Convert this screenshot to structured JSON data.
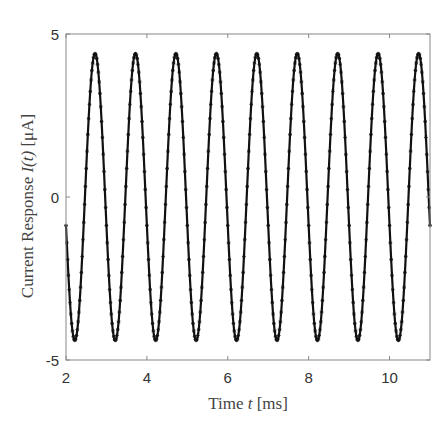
{
  "chart_data": {
    "type": "line",
    "title": "",
    "xlabel": "Time t [ms]",
    "ylabel": "Current Response I(t) [μA]",
    "xlabel_parts": [
      "Time ",
      "t",
      " [ms]"
    ],
    "ylabel_parts": [
      "Current Response ",
      "I(t)",
      " [μA]"
    ],
    "xlim": [
      2,
      11
    ],
    "ylim": [
      -5,
      5
    ],
    "xticks": [
      2,
      4,
      6,
      8,
      10
    ],
    "yticks": [
      -5,
      0,
      5
    ],
    "xtick_labels": [
      "2",
      "4",
      "6",
      "8",
      "10"
    ],
    "ytick_labels": [
      "-5",
      "0",
      "5"
    ],
    "grid": false,
    "legend": null,
    "series": [
      {
        "name": "I(t)",
        "color": "#111111",
        "marker": "asterisk",
        "line": "solid",
        "model": "I(t) = -4.4 * sin(2*pi*1.0*(t - 2) + 0.2)",
        "amplitude": 4.4,
        "frequency_khz": 1.0,
        "phase_offset": 0.2,
        "sample_step_ms": 0.02,
        "key_points": {
          "start": [
            2.0,
            -1.0
          ],
          "first_trough": [
            2.22,
            -4.4
          ],
          "peaks_t": [
            2.72,
            3.72,
            4.72,
            5.72,
            6.72,
            7.72,
            8.72,
            9.72,
            10.72
          ],
          "troughs_t": [
            2.22,
            3.22,
            4.22,
            5.22,
            6.22,
            7.22,
            8.22,
            9.22,
            10.22
          ],
          "end": [
            11.0,
            -1.0
          ]
        }
      }
    ]
  },
  "colors": {
    "axis": "#888888",
    "line": "#111111",
    "text": "#333333"
  }
}
